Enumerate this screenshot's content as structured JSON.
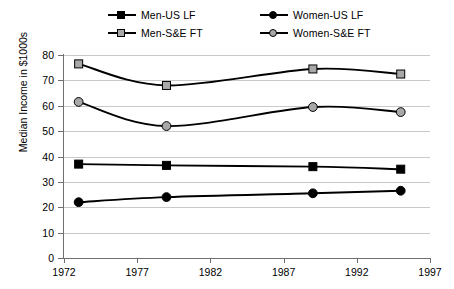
{
  "legend": {
    "items": [
      {
        "label": "Men-US LF",
        "marker": "square-filled-black",
        "row": 0,
        "col": 0
      },
      {
        "label": "Women-US LF",
        "marker": "circle-filled-black",
        "row": 0,
        "col": 1
      },
      {
        "label": "Men-S&E FT",
        "marker": "square-filled-gray",
        "row": 1,
        "col": 0
      },
      {
        "label": "Women-S&E FT",
        "marker": "circle-filled-gray",
        "row": 1,
        "col": 1
      }
    ]
  },
  "axes": {
    "y_label": "Median Income in $1000s",
    "y_ticks": [
      "0",
      "10",
      "20",
      "30",
      "40",
      "50",
      "60",
      "70",
      "80"
    ],
    "x_ticks": [
      "1972",
      "1977",
      "1982",
      "1987",
      "1992",
      "1997"
    ]
  },
  "chart_data": {
    "type": "line",
    "title": "",
    "xlabel": "",
    "ylabel": "Median Income in $1000s",
    "xlim": [
      1972,
      1997
    ],
    "ylim": [
      0,
      80
    ],
    "x_tick_values": [
      1972,
      1977,
      1982,
      1987,
      1992,
      1997
    ],
    "y_tick_values": [
      0,
      10,
      20,
      30,
      40,
      50,
      60,
      70,
      80
    ],
    "grid": "horizontal",
    "legend_position": "top",
    "x": [
      1973,
      1979,
      1989,
      1995
    ],
    "series": [
      {
        "name": "Men-S&E FT",
        "color": "#a8a8a8",
        "line_color": "#000000",
        "marker": "square",
        "values": [
          76.5,
          68.0,
          74.5,
          72.5
        ]
      },
      {
        "name": "Women-S&E FT",
        "color": "#a8a8a8",
        "line_color": "#000000",
        "marker": "circle",
        "values": [
          61.5,
          52.0,
          59.5,
          57.5
        ]
      },
      {
        "name": "Men-US LF",
        "color": "#000000",
        "line_color": "#000000",
        "marker": "square",
        "values": [
          37.0,
          36.5,
          36.0,
          35.0
        ]
      },
      {
        "name": "Women-US LF",
        "color": "#000000",
        "line_color": "#000000",
        "marker": "circle",
        "values": [
          22.0,
          24.0,
          25.5,
          26.5
        ]
      }
    ]
  }
}
